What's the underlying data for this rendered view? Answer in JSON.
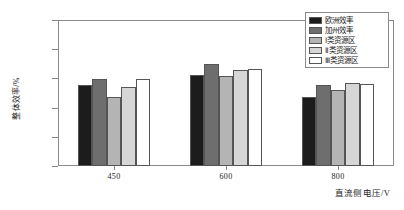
{
  "chart_data": {
    "type": "bar",
    "title": "",
    "xlabel": "直流侧电压/V",
    "ylabel": "整体效率/%",
    "categories": [
      "450",
      "600",
      "800"
    ],
    "ylim": [
      0.96,
      0.97
    ],
    "yticks": [
      "0.970",
      "0.968",
      "0.966",
      "0.964",
      "0.962",
      "0.960"
    ],
    "ytick_values": [
      0.97,
      0.968,
      0.966,
      0.964,
      0.962,
      0.96
    ],
    "grid": false,
    "legend_position": "top-right",
    "series": [
      {
        "name": "欧洲效率",
        "color": "#1c1c1c",
        "values": [
          0.96553,
          0.9662,
          0.9647
        ]
      },
      {
        "name": "加州效率",
        "color": "#6e6e6e",
        "values": [
          0.96595,
          0.967,
          0.96555
        ]
      },
      {
        "name": "Ⅰ类资源区",
        "color": "#b4b4b4",
        "values": [
          0.96475,
          0.96615,
          0.9652
        ]
      },
      {
        "name": "Ⅱ类资源区",
        "color": "#d6d6d6",
        "values": [
          0.9654,
          0.9666,
          0.9657
        ]
      },
      {
        "name": "Ⅲ类资源区",
        "color": "#ffffff",
        "values": [
          0.96595,
          0.96665,
          0.96565
        ]
      }
    ]
  }
}
